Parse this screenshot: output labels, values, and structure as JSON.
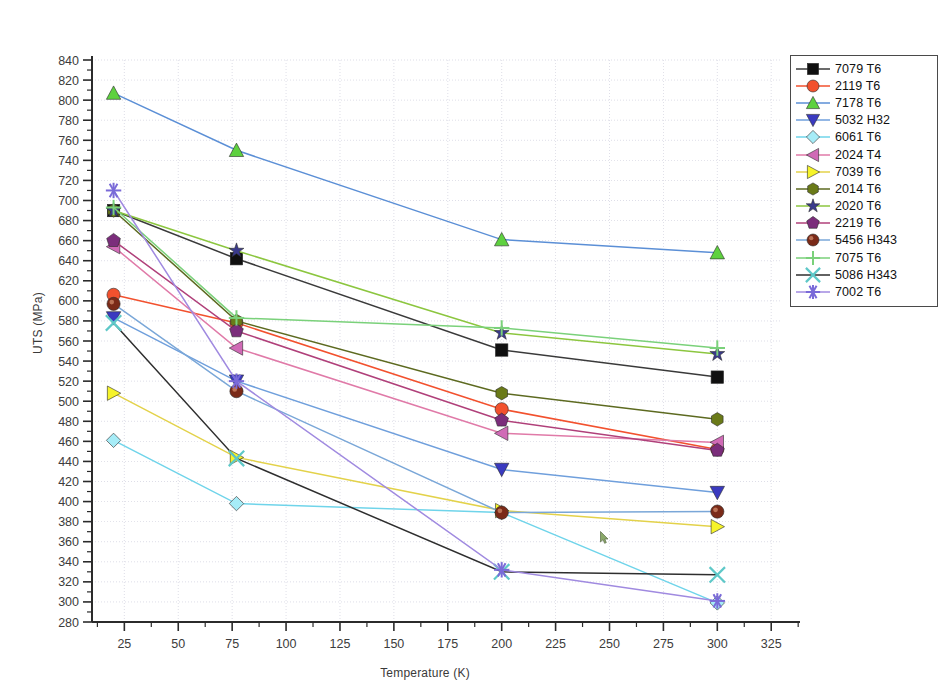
{
  "chart_data": {
    "type": "line",
    "title": "",
    "xlabel": "Temperature (K)",
    "ylabel": "UTS (MPa)",
    "xlim": [
      10,
      330
    ],
    "ylim": [
      280,
      840
    ],
    "xticks": [
      25,
      50,
      75,
      100,
      125,
      150,
      175,
      200,
      225,
      250,
      275,
      300,
      325
    ],
    "yticks": [
      280,
      300,
      320,
      340,
      360,
      380,
      400,
      420,
      440,
      460,
      480,
      500,
      520,
      540,
      560,
      580,
      600,
      620,
      640,
      660,
      680,
      700,
      720,
      740,
      760,
      780,
      800,
      820,
      840
    ],
    "grid": true,
    "minor_ticks": true,
    "legend_position": "top-right",
    "x": [
      20,
      77,
      200,
      300
    ],
    "series": [
      {
        "name": "7079 T6",
        "marker": "square",
        "color": "#101010",
        "line_color": "#3a3a3a",
        "values": [
          690,
          642,
          551,
          524
        ]
      },
      {
        "name": "2119 T6",
        "marker": "circle",
        "color": "#f2512e",
        "line_color": "#f2512e",
        "values": [
          606,
          578,
          492,
          452
        ]
      },
      {
        "name": "7178 T6",
        "marker": "triangle-up",
        "color": "#5ed13f",
        "line_color": "#5b8fd6",
        "values": [
          807,
          750,
          661,
          648
        ]
      },
      {
        "name": "5032 H32",
        "marker": "triangle-down",
        "color": "#3a3ac0",
        "line_color": "#6f9fdc",
        "values": [
          583,
          520,
          432,
          409
        ]
      },
      {
        "name": "6061 T6",
        "marker": "diamond",
        "color": "#a6ecf7",
        "line_color": "#6fd4ea",
        "values": [
          461,
          398,
          389,
          299
        ]
      },
      {
        "name": "2024 T4",
        "marker": "triangle-left",
        "color": "#d06ab6",
        "line_color": "#e07aa8",
        "values": [
          654,
          553,
          468,
          459
        ]
      },
      {
        "name": "7039 T6",
        "marker": "triangle-right",
        "color": "#f6f42a",
        "line_color": "#e3d24a",
        "values": [
          508,
          444,
          391,
          375
        ]
      },
      {
        "name": "2014 T6",
        "marker": "hexagon",
        "color": "#6a7a18",
        "line_color": "#5d6a20",
        "values": [
          690,
          580,
          508,
          482
        ]
      },
      {
        "name": "2020 T6",
        "marker": "star",
        "color": "#3a3a8c",
        "line_color": "#8cc63f",
        "values": [
          690,
          650,
          568,
          547
        ]
      },
      {
        "name": "2219 T6",
        "marker": "pentagon",
        "color": "#7b2d7b",
        "line_color": "#b0407a",
        "values": [
          660,
          570,
          481,
          451
        ]
      },
      {
        "name": "5456 H343",
        "marker": "circle-3d",
        "color": "#7a2a18",
        "line_color": "#7aa7d8",
        "values": [
          597,
          510,
          389,
          390
        ]
      },
      {
        "name": "7075 T6",
        "marker": "plus",
        "color": "#7ad17a",
        "line_color": "#7ad17a",
        "values": [
          693,
          583,
          573,
          553
        ]
      },
      {
        "name": "5086 H343",
        "marker": "x-cross",
        "color": "#5ec8c8",
        "line_color": "#2e2e2e",
        "values": [
          578,
          443,
          330,
          327
        ]
      },
      {
        "name": "7002 T6",
        "marker": "asterisk",
        "color": "#7a6ad8",
        "line_color": "#a08ae0",
        "values": [
          710,
          520,
          332,
          301
        ]
      }
    ]
  },
  "legend": {
    "items": [
      {
        "label": "7079 T6"
      },
      {
        "label": "2119 T6"
      },
      {
        "label": "7178 T6"
      },
      {
        "label": "5032 H32"
      },
      {
        "label": "6061 T6"
      },
      {
        "label": "2024 T4"
      },
      {
        "label": "7039 T6"
      },
      {
        "label": "2014 T6"
      },
      {
        "label": "2020 T6"
      },
      {
        "label": "2219 T6"
      },
      {
        "label": "5456 H343"
      },
      {
        "label": "7075 T6"
      },
      {
        "label": "5086 H343"
      },
      {
        "label": "7002 T6"
      }
    ]
  },
  "axes": {
    "x_title": "Temperature (K)",
    "y_title": "UTS (MPa)"
  },
  "colors": {
    "plot_border": "#2b2b2b",
    "grid": "#c8c8d8",
    "background": "#ffffff"
  }
}
